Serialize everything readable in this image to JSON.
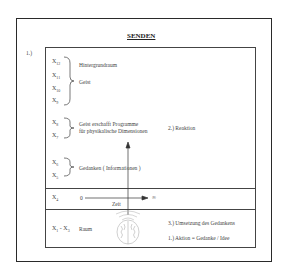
{
  "title": "SENDEN",
  "section_number": "1.)",
  "groups": [
    {
      "variables": [
        {
          "base": "X",
          "sub": "12"
        },
        {
          "base": "X",
          "sub": "11"
        },
        {
          "base": "X",
          "sub": "10"
        },
        {
          "base": "X",
          "sub": "9"
        }
      ],
      "labels": [
        "Hintergrundraum",
        "Geist"
      ]
    },
    {
      "variables": [
        {
          "base": "X",
          "sub": "8"
        },
        {
          "base": "X",
          "sub": "7"
        }
      ],
      "labels": [
        "Geist erschafft Programme",
        "für physikalische Dimensionen"
      ]
    },
    {
      "variables": [
        {
          "base": "X",
          "sub": "6"
        },
        {
          "base": "X",
          "sub": "5"
        }
      ],
      "labels": [
        "Gedanken  ( Informationen )"
      ]
    }
  ],
  "time_row": {
    "variable": {
      "base": "X",
      "sub": "4"
    },
    "start": "0",
    "end": "∞",
    "axis_label": "Zeit"
  },
  "space_row": {
    "variable": {
      "base": "X",
      "sub": "1",
      "sep": " - ",
      "base2": "X",
      "sub2": "3"
    },
    "label": "Raum"
  },
  "annotations": {
    "reaction": "2.)  Reaktion",
    "implementation": "3.)  Umsetzung des Gedankens",
    "action": "1.)  Aktion  =  Gedanke / Idee"
  },
  "icons": {
    "brain": "brain-icon",
    "signal": "signal-waves-icon"
  },
  "colors": {
    "border": "#2a2a2a",
    "text": "#444444",
    "brain": "#b0b0b0"
  }
}
